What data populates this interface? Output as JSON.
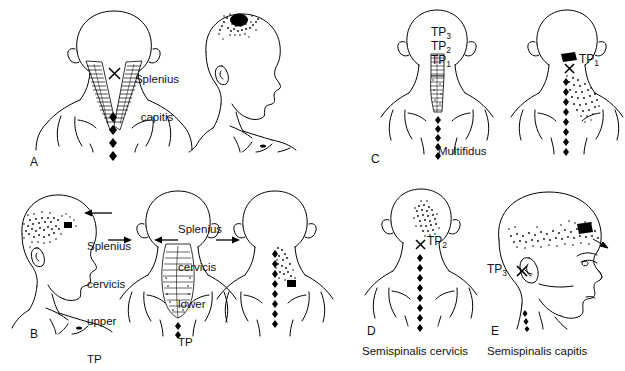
{
  "figure": {
    "title_visible": false,
    "background": "#ffffff",
    "ink_color": "#000000",
    "panels": [
      {
        "letter": "A",
        "muscle_label": "Splenius\ncapitis",
        "muscle_label_line1": "Splenius",
        "muscle_label_line2": "capitis",
        "views": [
          {
            "name": "posterior-neck-view",
            "markers": [
              "trigger-point-x"
            ],
            "muscle": "splenius-capitis-hatched-v"
          },
          {
            "name": "lateral-head-view",
            "markers": [
              "vertex-pain-spot"
            ],
            "referred_pain": "vertex-stipple"
          }
        ]
      },
      {
        "letter": "B",
        "label_upper_line1": "Splenius",
        "label_upper_line2": "cervicis",
        "label_upper_line3": "upper",
        "label_upper_line4": "TP",
        "label_lower_line1": "Splenius",
        "label_lower_line2": "cervicis",
        "label_lower_line3": "lower",
        "label_lower_line4": "TP",
        "views": [
          {
            "name": "lateral-head-view",
            "referred_pain": "orbital-occipital-stipple"
          },
          {
            "name": "posterior-neck-view-muscle",
            "muscle": "splenius-cervicis-hatched"
          },
          {
            "name": "posterior-neck-shoulder-view",
            "referred_pain": "neck-angle-stipple"
          }
        ]
      },
      {
        "letter": "C",
        "caption": "Multifidus",
        "tp_labels": [
          "TP3",
          "TP2",
          "TP1"
        ],
        "tp3": "TP",
        "tp3_sub": "3",
        "tp2": "TP",
        "tp2_sub": "2",
        "tp1": "TP",
        "tp1_sub": "1",
        "tp1_right": "TP",
        "tp1_right_sub": "1",
        "views": [
          {
            "name": "posterior-view-multifidus-muscle"
          },
          {
            "name": "posterior-view-referred-pain-tp1"
          }
        ]
      },
      {
        "letter": "D",
        "caption": "Semispinalis cervicis",
        "tp_label": "TP",
        "tp_sub": "2",
        "views": [
          {
            "name": "posterior-view-occipital-pain"
          }
        ]
      },
      {
        "letter": "E",
        "caption": "Semispinalis capitis",
        "tp_label": "TP",
        "tp_sub": "3",
        "views": [
          {
            "name": "lateral-head-headband-pain"
          }
        ]
      }
    ]
  }
}
